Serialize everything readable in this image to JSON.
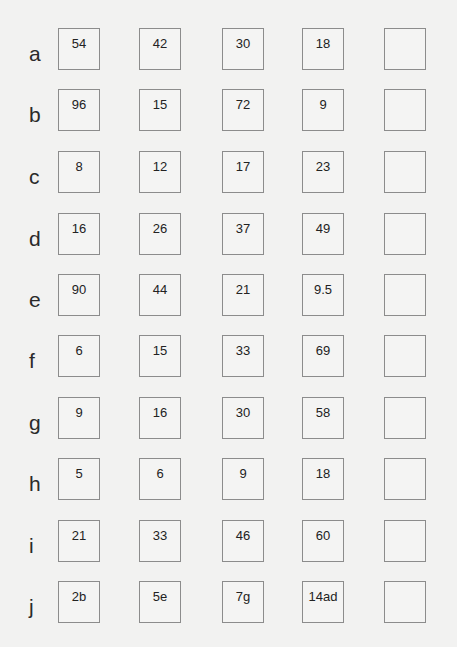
{
  "worksheet": {
    "rows": [
      {
        "label": "a",
        "values": [
          "54",
          "42",
          "30",
          "18",
          ""
        ]
      },
      {
        "label": "b",
        "values": [
          "96",
          "15",
          "72",
          "9",
          ""
        ]
      },
      {
        "label": "c",
        "values": [
          "8",
          "12",
          "17",
          "23",
          ""
        ]
      },
      {
        "label": "d",
        "values": [
          "16",
          "26",
          "37",
          "49",
          ""
        ]
      },
      {
        "label": "e",
        "values": [
          "90",
          "44",
          "21",
          "9.5",
          ""
        ]
      },
      {
        "label": "f",
        "values": [
          "6",
          "15",
          "33",
          "69",
          ""
        ]
      },
      {
        "label": "g",
        "values": [
          "9",
          "16",
          "30",
          "58",
          ""
        ]
      },
      {
        "label": "h",
        "values": [
          "5",
          "6",
          "9",
          "18",
          ""
        ]
      },
      {
        "label": "i",
        "values": [
          "21",
          "33",
          "46",
          "60",
          ""
        ]
      },
      {
        "label": "j",
        "values": [
          "2b",
          "5e",
          "7g",
          "14ad",
          ""
        ]
      }
    ]
  }
}
